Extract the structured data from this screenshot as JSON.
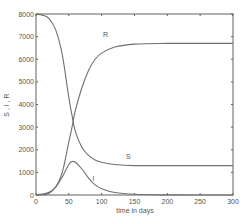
{
  "chart_data": {
    "type": "line",
    "title": "",
    "xlabel": "time in days",
    "ylabel": "S , I , R",
    "xlim": [
      0,
      300
    ],
    "ylim": [
      0,
      8000
    ],
    "xticks": [
      0,
      50,
      100,
      150,
      200,
      250,
      300
    ],
    "yticks": [
      0,
      1000,
      2000,
      3000,
      4000,
      5000,
      6000,
      7000,
      8000
    ],
    "grid": false,
    "legend": "inline labels",
    "x": [
      0,
      10,
      20,
      30,
      40,
      50,
      55,
      60,
      70,
      80,
      90,
      100,
      120,
      150,
      200,
      250,
      300
    ],
    "series": [
      {
        "name": "S",
        "values": [
          7990,
          7950,
          7800,
          7300,
          6200,
          4300,
          3500,
          2800,
          2100,
          1750,
          1550,
          1450,
          1350,
          1300,
          1300,
          1300,
          1300
        ]
      },
      {
        "name": "I",
        "values": [
          10,
          40,
          120,
          350,
          800,
          1350,
          1480,
          1450,
          1150,
          750,
          450,
          280,
          110,
          30,
          5,
          0,
          0
        ]
      },
      {
        "name": "R",
        "values": [
          0,
          10,
          80,
          350,
          1000,
          2350,
          3020,
          3750,
          4750,
          5500,
          6000,
          6270,
          6540,
          6670,
          6700,
          6700,
          6700
        ]
      }
    ],
    "annotations": [
      {
        "text": "R",
        "x": 102,
        "y": 7000
      },
      {
        "text": "S",
        "x": 137,
        "y": 1600
      },
      {
        "text": "I",
        "x": 86,
        "y": 600
      }
    ]
  },
  "labels": {
    "xlabel": "time in days",
    "ylabel": "S , I , R",
    "R": "R",
    "S": "S",
    "I": "I"
  },
  "colors": {
    "line": "#707070",
    "axis": "#606060",
    "text": "#555555"
  }
}
